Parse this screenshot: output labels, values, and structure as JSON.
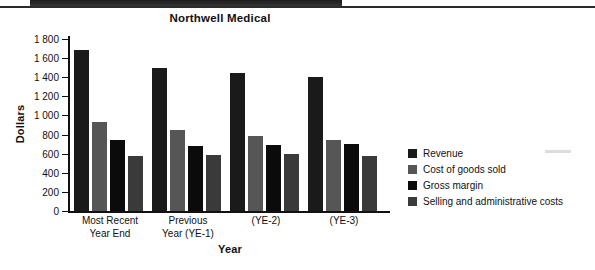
{
  "page": {
    "background_color": "#ffffff",
    "scan_band_color": "#2a2a2a"
  },
  "chart_data": {
    "type": "bar",
    "title": "Northwell Medical",
    "xlabel": "Year",
    "ylabel": "Dollars",
    "grid": false,
    "legend_position": "right",
    "ylim": [
      0,
      1800
    ],
    "yticks": [
      0,
      200,
      400,
      600,
      800,
      1000,
      1200,
      1400,
      1600,
      1800
    ],
    "ytick_labels": [
      "0",
      "200",
      "400",
      "600",
      "800",
      "1 000",
      "1 200",
      "1 400",
      "1 600",
      "1 800"
    ],
    "categories": [
      "Most Recent\nYear End",
      "Previous\nYear (YE-1)",
      "(YE-2)",
      "(YE-3)"
    ],
    "category_lines": [
      [
        "Most Recent",
        "Year End"
      ],
      [
        "Previous",
        "Year (YE-1)"
      ],
      [
        "(YE-2)",
        ""
      ],
      [
        "(YE-3)",
        ""
      ]
    ],
    "series": [
      {
        "name": "Revenue",
        "color": "#1a1a1a",
        "values": [
          1680,
          1500,
          1440,
          1400
        ]
      },
      {
        "name": "Cost of goods sold",
        "color": "#565656",
        "values": [
          930,
          850,
          790,
          740
        ]
      },
      {
        "name": "Gross margin",
        "color": "#0b0b0b",
        "values": [
          740,
          680,
          690,
          700
        ]
      },
      {
        "name": "Selling and administrative costs",
        "color": "#3a3a3a",
        "values": [
          580,
          585,
          600,
          580
        ]
      }
    ]
  }
}
